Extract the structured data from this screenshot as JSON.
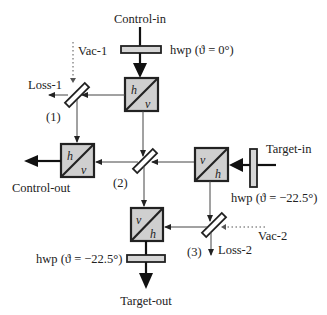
{
  "diagram": {
    "type": "optical-setup",
    "inputs": {
      "control_in": "Control-in",
      "target_in": "Target-in",
      "vac_1": "Vac-1",
      "vac_2": "Vac-2"
    },
    "outputs": {
      "control_out": "Control-out",
      "target_out": "Target-out",
      "loss_1": "Loss-1",
      "loss_2": "Loss-2"
    },
    "waveplates": {
      "hwp_control_in": "hwp (ϑ = 0°)",
      "hwp_target_in": "hwp (ϑ = −22.5°)",
      "hwp_target_out": "hwp (ϑ = −22.5°)"
    },
    "beam_splitters": {
      "bs1": "(1)",
      "bs2": "(2)",
      "bs3": "(3)"
    },
    "pbs": [
      {
        "top": "h",
        "bottom": "v"
      },
      {
        "top": "h",
        "bottom": "v"
      },
      {
        "top": "v",
        "bottom": "h"
      },
      {
        "top": "v",
        "bottom": "h"
      }
    ]
  }
}
